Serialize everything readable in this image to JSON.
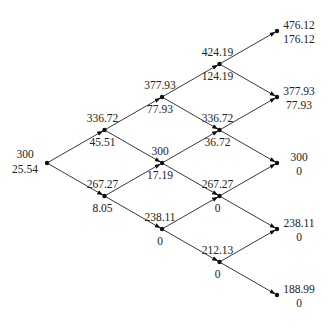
{
  "diagram": {
    "type": "binomial-tree",
    "steps": 4,
    "levels": [
      [
        {
          "value": "300",
          "option": "25.54"
        }
      ],
      [
        {
          "value": "336.72",
          "option": "45.51"
        },
        {
          "value": "267.27",
          "option": "8.05"
        }
      ],
      [
        {
          "value": "377.93",
          "option": "77.93"
        },
        {
          "value": "300",
          "option": "17.19"
        },
        {
          "value": "238.11",
          "option": "0"
        }
      ],
      [
        {
          "value": "424.19",
          "option": "124.19"
        },
        {
          "value": "336.72",
          "option": "36.72"
        },
        {
          "value": "267.27",
          "option": "0"
        },
        {
          "value": "212.13",
          "option": "0"
        }
      ],
      [
        {
          "value": "476.12",
          "option": "176.12"
        },
        {
          "value": "377.93",
          "option": "77.93"
        },
        {
          "value": "300",
          "option": "0"
        },
        {
          "value": "238.11",
          "option": "0"
        },
        {
          "value": "188.99",
          "option": "0"
        }
      ]
    ]
  }
}
